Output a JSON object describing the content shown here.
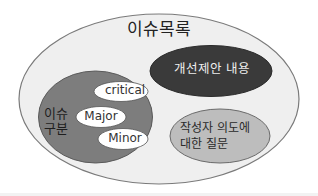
{
  "diagram": {
    "type": "nested-venn",
    "title": "이슈목록",
    "regions": {
      "issue_category": {
        "label_lines": [
          "이슈",
          "구분"
        ],
        "items": [
          {
            "label": "critical"
          },
          {
            "label": "Major"
          },
          {
            "label": "Minor"
          }
        ]
      },
      "improvement_suggestion": {
        "label": "개선제안 내용"
      },
      "author_intent_question": {
        "label_lines": [
          "작성자 의도에",
          "대한 질문"
        ]
      }
    },
    "colors": {
      "outer_fill": "#efefef",
      "outer_stroke": "#7a7a7a",
      "category_fill": "#7d7d7d",
      "tag_fill": "#ffffff",
      "suggestion_fill": "#3a3a3a",
      "question_fill": "#bdbdbd"
    }
  }
}
